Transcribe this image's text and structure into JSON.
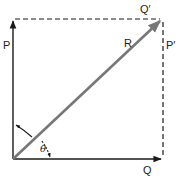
{
  "diagram": {
    "type": "vector-parallelogram",
    "colors": {
      "component_vectors": "#1a1a1a",
      "resultant": "#777777",
      "dashed_lines": "#1a1a1a",
      "background": "#ffffff"
    },
    "labels": {
      "p": "P",
      "q": "Q",
      "r": "R",
      "p_prime": "P′",
      "q_prime": "Q′",
      "theta": "θ"
    },
    "vectors": [
      {
        "name": "P",
        "from": [
          13,
          159
        ],
        "to": [
          13,
          20
        ],
        "style": "solid"
      },
      {
        "name": "Q",
        "from": [
          13,
          159
        ],
        "to": [
          162,
          159
        ],
        "style": "solid"
      },
      {
        "name": "R",
        "from": [
          13,
          159
        ],
        "to": [
          162,
          19
        ],
        "style": "solid-gray"
      },
      {
        "name": "Q'",
        "from": [
          13,
          19
        ],
        "to": [
          162,
          19
        ],
        "style": "dashed"
      },
      {
        "name": "P'",
        "from": [
          162,
          19
        ],
        "to": [
          162,
          159
        ],
        "style": "dashed"
      }
    ]
  }
}
